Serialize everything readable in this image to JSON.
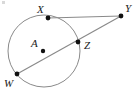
{
  "figure": {
    "type": "geometry-diagram",
    "width": 139,
    "height": 96,
    "background_color": "#ffffff",
    "stroke_color": "#808080",
    "point_color": "#111111",
    "label_color": "#1a1a1a",
    "circle": {
      "name": "circle-A",
      "center_label": "A",
      "center": {
        "x": 44,
        "y": 51
      },
      "radius": 36
    },
    "points": [
      {
        "id": "X",
        "label": "X",
        "x": 48,
        "y": 18,
        "label_x": 37,
        "label_y": 4
      },
      {
        "id": "Y",
        "label": "Y",
        "x": 121,
        "y": 16,
        "label_x": 125,
        "label_y": 3
      },
      {
        "id": "Z",
        "label": "Z",
        "x": 78,
        "y": 42,
        "label_x": 84,
        "label_y": 40
      },
      {
        "id": "W",
        "label": "W",
        "x": 17,
        "y": 74,
        "label_x": 4,
        "label_y": 78
      },
      {
        "id": "A",
        "label": "A",
        "x": 43,
        "y": 51,
        "label_x": 31,
        "label_y": 38
      }
    ],
    "segments": [
      {
        "name": "tangent-XY",
        "from": "X",
        "to": "Y"
      },
      {
        "name": "secant-WY",
        "from": "W",
        "to": "Y"
      }
    ]
  }
}
